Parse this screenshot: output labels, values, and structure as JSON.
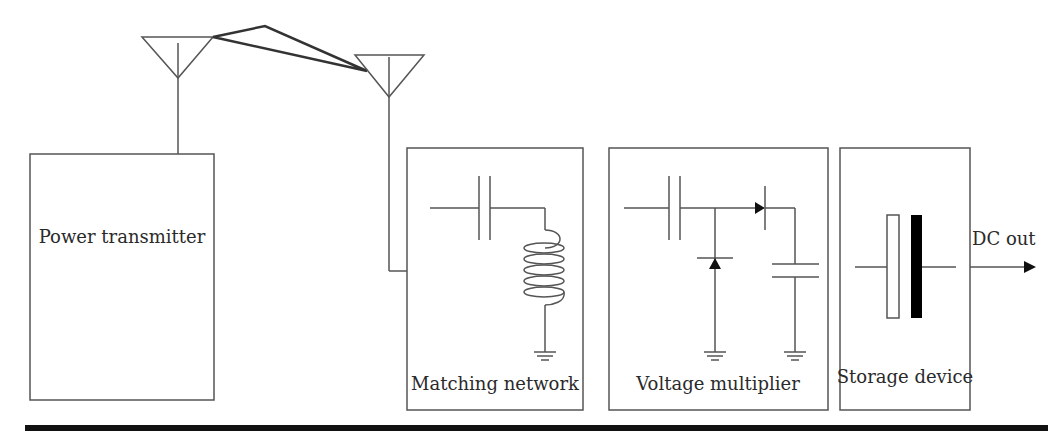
{
  "diagram": {
    "blocks": {
      "transmitter": {
        "label": "Power transmitter"
      },
      "matching": {
        "label": "Matching network"
      },
      "multiplier": {
        "label": "Voltage multiplier"
      },
      "storage": {
        "label": "Storage device"
      }
    },
    "output": {
      "label": "DC out"
    },
    "components": {
      "antennas": [
        "transmit-antenna",
        "receive-antenna"
      ],
      "matching_network": [
        "series-capacitor",
        "shunt-inductor",
        "ground"
      ],
      "voltage_multiplier": [
        "series-capacitor",
        "shunt-diode",
        "series-diode",
        "shunt-capacitor",
        "ground",
        "ground"
      ],
      "storage_device": [
        "capacitor-plate-white",
        "capacitor-plate-black"
      ]
    },
    "colors": {
      "line": "#555555",
      "beam": "#333333",
      "plate_fill": "#000000",
      "text": "#2a2a2a"
    }
  }
}
